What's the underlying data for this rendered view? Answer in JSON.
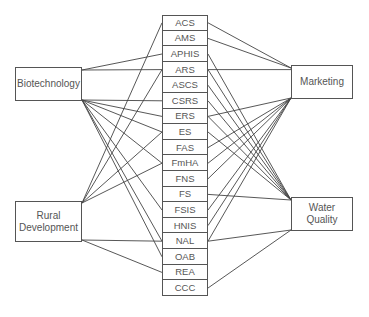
{
  "left_nodes": [
    {
      "id": "biotech",
      "label": "Biotechnology"
    },
    {
      "id": "rural",
      "label": "Rural Development"
    }
  ],
  "right_nodes": [
    {
      "id": "marketing",
      "label": "Marketing"
    },
    {
      "id": "water",
      "label": "Water Quality"
    }
  ],
  "agencies": [
    "ACS",
    "AMS",
    "APHIS",
    "ARS",
    "ASCS",
    "CSRS",
    "ERS",
    "ES",
    "FAS",
    "FmHA",
    "FNS",
    "FS",
    "FSIS",
    "HNIS",
    "NAL",
    "OAB",
    "REA",
    "CCC"
  ],
  "connections": {
    "biotech": [
      "APHIS",
      "ARS",
      "CSRS",
      "ERS",
      "ES",
      "FSIS",
      "NAL",
      "OAB",
      "FmHA"
    ],
    "rural": [
      "ACS",
      "ARS",
      "ES",
      "FmHA",
      "NAL",
      "REA"
    ],
    "marketing": [
      "ACS",
      "AMS",
      "ARS",
      "FAS",
      "FmHA",
      "FNS",
      "FSIS",
      "HNIS",
      "NAL",
      "ERS"
    ],
    "water": [
      "APHIS",
      "ARS",
      "ASCS",
      "CSRS",
      "ERS",
      "ES",
      "FS",
      "NAL",
      "CCC"
    ]
  },
  "line_color": "#444444"
}
